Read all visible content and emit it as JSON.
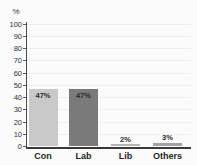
{
  "chart_data": {
    "type": "bar",
    "title": "",
    "xlabel": "",
    "ylabel": "%",
    "categories": [
      "Con",
      "Lab",
      "Lib",
      "Others"
    ],
    "values": [
      47,
      47,
      2,
      3
    ],
    "value_labels": [
      "47%",
      "47%",
      "2%",
      "3%"
    ],
    "bar_colors": [
      "#c9c9c9",
      "#7a7a7a",
      "#b4b4b4",
      "#a2a2a2"
    ],
    "ylim": [
      0,
      100
    ],
    "yticks": [
      0,
      10,
      20,
      30,
      40,
      50,
      60,
      70,
      80,
      90,
      100
    ],
    "grid": "horizontal-faint",
    "legend": "none"
  },
  "style_colors": {
    "axis": "#4a4a4a",
    "grid": "#eeeeee",
    "tick_text": "#333333",
    "category_text": "#1f1f1f",
    "background": "#fbfbfb"
  }
}
